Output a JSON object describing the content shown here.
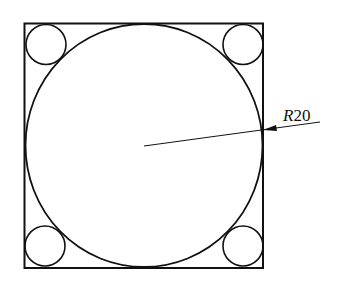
{
  "diagram": {
    "type": "engineering-drawing",
    "dimension_label": {
      "prefix": "R",
      "value": "20"
    },
    "colors": {
      "stroke": "#111111",
      "background": "#ffffff"
    }
  }
}
